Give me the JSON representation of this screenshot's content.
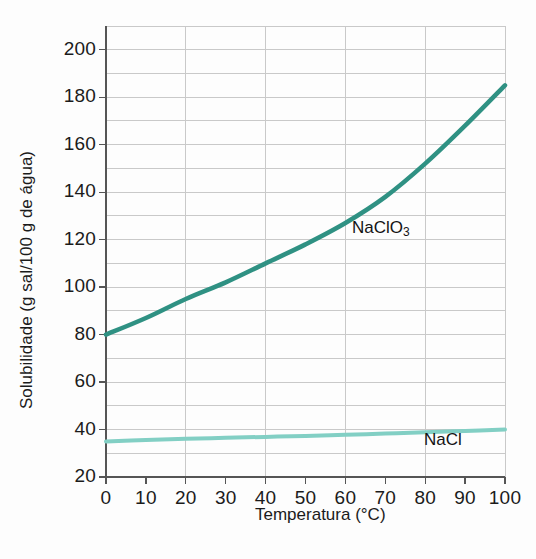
{
  "figure": {
    "background_color": "#fdfdfd",
    "axis_color": "#555555",
    "grid_color": "#c9c9c9"
  },
  "axes": {
    "ylabel": "Solubilidade (g sal/100 g de água)",
    "xlabel": "Temperatura (°C)",
    "yticks": [
      "20",
      "40",
      "60",
      "80",
      "100",
      "120",
      "140",
      "160",
      "180",
      "200"
    ],
    "xticks": [
      "0",
      "10",
      "20",
      "30",
      "40",
      "50",
      "60",
      "70",
      "80",
      "90",
      "100"
    ]
  },
  "labels": {
    "naclo3_main": "NaClO",
    "naclo3_sub": "3",
    "nacl": "NaCl"
  },
  "chart_data": {
    "type": "line",
    "title": "",
    "xlabel": "Temperatura (°C)",
    "ylabel": "Solubilidade (g sal/100 g de água)",
    "xlim": [
      0,
      100
    ],
    "ylim": [
      20,
      210
    ],
    "xticks": [
      0,
      10,
      20,
      30,
      40,
      50,
      60,
      70,
      80,
      90,
      100
    ],
    "yticks": [
      20,
      40,
      60,
      80,
      100,
      120,
      140,
      160,
      180,
      200
    ],
    "grid": true,
    "grid_x_step": 20,
    "grid_y_step": 10,
    "legend": "inline-annotations",
    "x": [
      0,
      10,
      20,
      30,
      40,
      50,
      60,
      70,
      80,
      90,
      100
    ],
    "series": [
      {
        "name": "NaClO3",
        "label": "NaClO₃",
        "color": "#2f9183",
        "width": 4.5,
        "values": [
          80,
          87,
          95,
          102,
          110,
          118,
          127,
          138,
          152,
          168,
          185
        ]
      },
      {
        "name": "NaCl",
        "label": "NaCl",
        "color": "#82cfc4",
        "width": 4.0,
        "values": [
          35,
          35.6,
          36.1,
          36.5,
          36.9,
          37.3,
          37.8,
          38.3,
          38.8,
          39.4,
          40
        ]
      }
    ]
  }
}
